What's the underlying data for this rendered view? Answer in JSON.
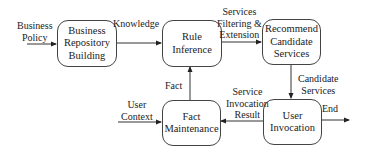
{
  "diagram": {
    "nodes": [
      {
        "id": "business-repository-building",
        "label": "Business Repository Building",
        "lines": [
          "Business",
          "Repository",
          "Building"
        ]
      },
      {
        "id": "rule-inference",
        "label": "Rule Inference",
        "lines": [
          "Rule",
          "Inference"
        ]
      },
      {
        "id": "recommend-candidate-services",
        "label": "Recommend Candidate Services",
        "lines": [
          "Recommend",
          "Candidate",
          "Services"
        ]
      },
      {
        "id": "fact-maintenance",
        "label": "Fact Maintenance",
        "lines": [
          "Fact",
          "Maintenance"
        ]
      },
      {
        "id": "user-invocation",
        "label": "User Invocation",
        "lines": [
          "User",
          "Invocation"
        ]
      }
    ],
    "edges": [
      {
        "from": "(external)",
        "to": "business-repository-building",
        "label": "Business Policy",
        "lines": [
          "Business",
          "Policy"
        ]
      },
      {
        "from": "business-repository-building",
        "to": "rule-inference",
        "label": "Knowledge",
        "lines": [
          "Knowledge"
        ]
      },
      {
        "from": "rule-inference",
        "to": "recommend-candidate-services",
        "label": "Services Filtering & Extension",
        "lines": [
          "Services",
          "Filtering &",
          "Extension"
        ]
      },
      {
        "from": "recommend-candidate-services",
        "to": "user-invocation",
        "label": "Candidate Services",
        "lines": [
          "Candidate",
          "Services"
        ]
      },
      {
        "from": "user-invocation",
        "to": "fact-maintenance",
        "label": "Service Invocation Result",
        "lines": [
          "Service",
          "Invocation",
          "Result"
        ]
      },
      {
        "from": "fact-maintenance",
        "to": "rule-inference",
        "label": "Fact",
        "lines": [
          "Fact"
        ]
      },
      {
        "from": "(external)",
        "to": "fact-maintenance",
        "label": "User Context",
        "lines": [
          "User",
          "Context"
        ]
      },
      {
        "from": "user-invocation",
        "to": "(external)",
        "label": "End",
        "lines": [
          "End"
        ]
      }
    ]
  }
}
